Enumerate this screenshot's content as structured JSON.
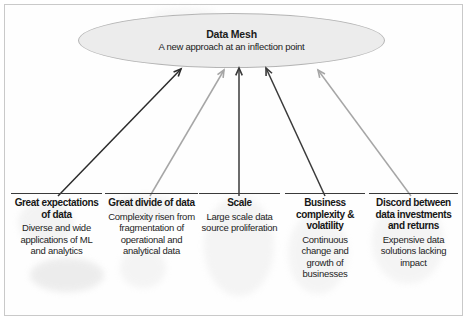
{
  "figure": {
    "background_color": "#ffffff",
    "frame_color": "#c9c9c9"
  },
  "center_node": {
    "name": "data-mesh-ellipse",
    "title": "Data Mesh",
    "subtitle": "A new approach at an inflection point",
    "fill_color": "#ececec",
    "border_color": "#b4b4b4"
  },
  "arrows": [
    {
      "id": "arrow-great-expectations",
      "color": "#2b2b2b",
      "from": [
        58,
        196
      ],
      "to": [
        181,
        69
      ]
    },
    {
      "id": "arrow-great-divide",
      "color": "#a6a6a6",
      "from": [
        150,
        196
      ],
      "to": [
        224,
        70
      ]
    },
    {
      "id": "arrow-scale",
      "color": "#3a3a3a",
      "from": [
        239,
        196
      ],
      "to": [
        239,
        68
      ]
    },
    {
      "id": "arrow-business-complexity",
      "color": "#3a3a3a",
      "from": [
        325,
        196
      ],
      "to": [
        266,
        68
      ]
    },
    {
      "id": "arrow-discord",
      "color": "#a6a6a6",
      "from": [
        411,
        196
      ],
      "to": [
        318,
        70
      ]
    }
  ],
  "columns": [
    {
      "id": "great-expectations-of-data",
      "heading": "Great expectations of data",
      "body": "Diverse and wide applications of ML and analytics",
      "left": 11,
      "width": 91
    },
    {
      "id": "great-divide-of-data",
      "heading": "Great divide of data",
      "body": "Complexity risen from fragmentation of operational and analytical data",
      "left": 105,
      "width": 93
    },
    {
      "id": "scale",
      "heading": "Scale",
      "body": "Large scale data source proliferation",
      "left": 199,
      "width": 81
    },
    {
      "id": "business-complexity-and-volatility",
      "heading": "Business complexity & volatility",
      "body": "Continuous change and growth of businesses",
      "left": 285,
      "width": 80
    },
    {
      "id": "discord-between-data-investments-and-returns",
      "heading": "Discord between data investments and returns",
      "body": "Expensive data solutions lacking impact",
      "left": 369,
      "width": 89
    }
  ]
}
